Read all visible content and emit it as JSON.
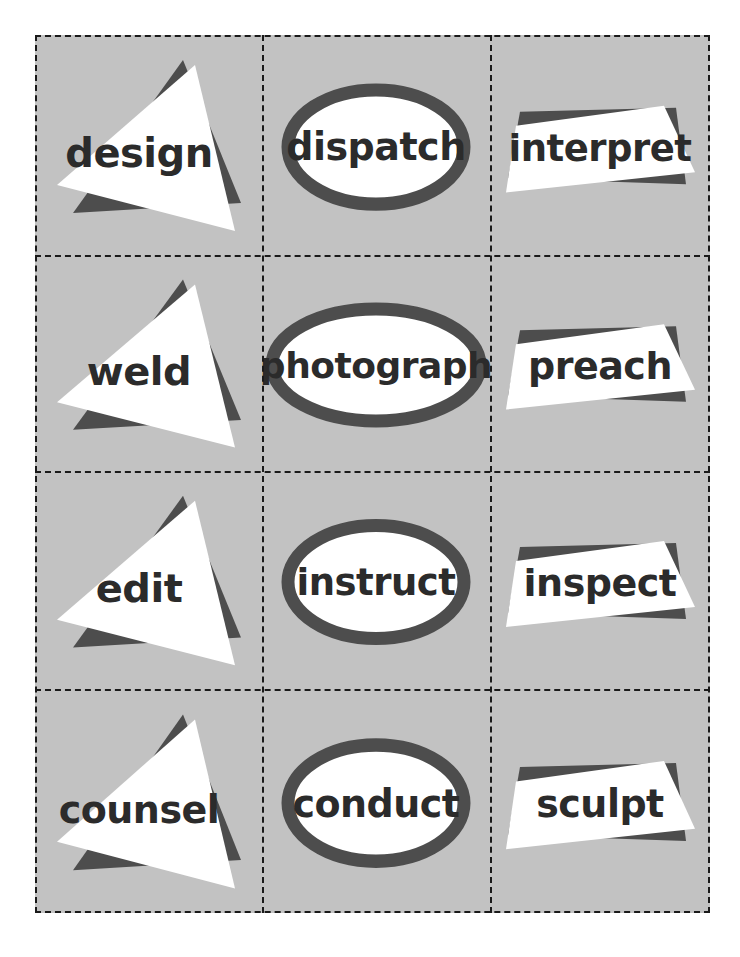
{
  "sheet": {
    "title": "Occupation verb flashcard sheet",
    "background_color": "#ffffff",
    "card_fill_color": "#c2c2c2",
    "cut_line_color": "#1a1a1a",
    "cut_line_style": "dashed",
    "shape_fill_color": "#ffffff",
    "shape_shadow_color": "#4d4d4d",
    "text_color": "#2b2b2b",
    "rows": 4,
    "columns": 3,
    "total_cards": 12
  },
  "cards": [
    {
      "word": "design",
      "shape": "triangle",
      "row": 1,
      "column": 1,
      "font_size": 40
    },
    {
      "word": "dispatch",
      "shape": "ellipse",
      "row": 1,
      "column": 2,
      "font_size": 38
    },
    {
      "word": "interpret",
      "shape": "quadrilateral",
      "row": 1,
      "column": 3,
      "font_size": 37
    },
    {
      "word": "weld",
      "shape": "triangle",
      "row": 2,
      "column": 1,
      "font_size": 40
    },
    {
      "word": "photograph",
      "shape": "ellipse",
      "row": 2,
      "column": 2,
      "font_size": 36
    },
    {
      "word": "preach",
      "shape": "quadrilateral",
      "row": 2,
      "column": 3,
      "font_size": 38
    },
    {
      "word": "edit",
      "shape": "triangle",
      "row": 3,
      "column": 1,
      "font_size": 40
    },
    {
      "word": "instruct",
      "shape": "ellipse",
      "row": 3,
      "column": 2,
      "font_size": 37
    },
    {
      "word": "inspect",
      "shape": "quadrilateral",
      "row": 3,
      "column": 3,
      "font_size": 38
    },
    {
      "word": "counsel",
      "shape": "triangle",
      "row": 4,
      "column": 1,
      "font_size": 38
    },
    {
      "word": "conduct",
      "shape": "ellipse",
      "row": 4,
      "column": 2,
      "font_size": 38
    },
    {
      "word": "sculpt",
      "shape": "quadrilateral",
      "row": 4,
      "column": 3,
      "font_size": 38
    }
  ]
}
